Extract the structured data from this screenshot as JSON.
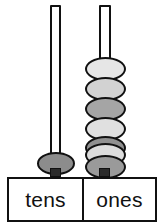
{
  "figure": {
    "kind": "place-value-abacus",
    "value_shown": 17,
    "colors": {
      "outline": "#111111",
      "background": "#ffffff",
      "rod_fill": "#ffffff",
      "rod_foot": "#2b2b2b"
    }
  },
  "columns": [
    {
      "id": "tens",
      "label": "tens",
      "bead_count": 1,
      "rod": {
        "x": 50,
        "y": 5,
        "width": 11,
        "height": 168
      },
      "beads": [
        {
          "index": 1,
          "y": 152,
          "color": "#8c8c8c"
        }
      ]
    },
    {
      "id": "ones",
      "label": "ones",
      "bead_count": 7,
      "rod": {
        "x": 99,
        "y": 5,
        "width": 12,
        "height": 168
      },
      "beads": [
        {
          "index": 1,
          "y": 57,
          "color": "#e6e6e6"
        },
        {
          "index": 2,
          "y": 77,
          "color": "#d2d2d2"
        },
        {
          "index": 3,
          "y": 97,
          "color": "#a5a5a5"
        },
        {
          "index": 4,
          "y": 117,
          "color": "#e0e0e0"
        },
        {
          "index": 5,
          "y": 136,
          "color": "#909090"
        },
        {
          "index": 6,
          "y": 143,
          "color": "#dcdcdc"
        },
        {
          "index": 7,
          "y": 155,
          "color": "#9a9a9a"
        }
      ]
    }
  ],
  "labels": {
    "tens": "tens",
    "ones": "ones"
  }
}
